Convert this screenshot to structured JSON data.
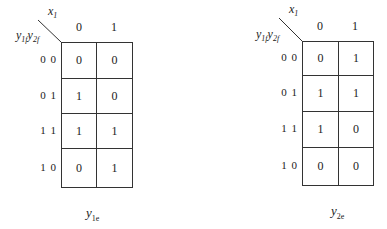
{
  "maps": [
    {
      "id": "y1e",
      "column_variable": {
        "base": "x",
        "sub": "1"
      },
      "row_variables": [
        {
          "base": "y",
          "sub": "1f"
        },
        {
          "base": "y",
          "sub": "2f"
        }
      ],
      "column_headers": [
        "0",
        "1"
      ],
      "row_headers": [
        "0 0",
        "0 1",
        "1 1",
        "1 0"
      ],
      "cells": [
        [
          "0",
          "0"
        ],
        [
          "1",
          "0"
        ],
        [
          "1",
          "1"
        ],
        [
          "0",
          "1"
        ]
      ],
      "title": {
        "base": "y",
        "sub": "1e"
      }
    },
    {
      "id": "y2e",
      "column_variable": {
        "base": "x",
        "sub": "1"
      },
      "row_variables": [
        {
          "base": "y",
          "sub": "1f"
        },
        {
          "base": "y",
          "sub": "2f"
        }
      ],
      "column_headers": [
        "0",
        "1"
      ],
      "row_headers": [
        "0 0",
        "0 1",
        "1 1",
        "1 0"
      ],
      "cells": [
        [
          "0",
          "1"
        ],
        [
          "1",
          "1"
        ],
        [
          "1",
          "0"
        ],
        [
          "0",
          "0"
        ]
      ],
      "title": {
        "base": "y",
        "sub": "2e"
      }
    }
  ]
}
